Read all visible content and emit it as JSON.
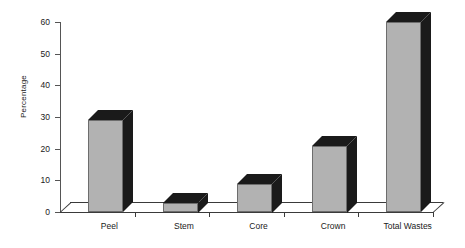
{
  "chart_data": {
    "type": "bar",
    "title": "",
    "subtitle": "",
    "xlabel": "",
    "ylabel": "Percentage",
    "categories": [
      "Peel",
      "Stem",
      "Core",
      "Crown",
      "Total Wastes"
    ],
    "values": [
      29,
      3,
      9,
      21,
      60
    ],
    "series": [
      {
        "name": "Percentage",
        "values": [
          29,
          3,
          9,
          21,
          60
        ]
      }
    ],
    "ylim": [
      0,
      60
    ],
    "yticks": [
      0,
      10,
      20,
      30,
      40,
      50,
      60
    ],
    "ytick_labels": [
      "0",
      "10",
      "20",
      "30",
      "40",
      "50",
      "60"
    ],
    "grid": false,
    "legend": false,
    "legend_position": "none",
    "style": "3d-column",
    "colors": {
      "bar_front": "#b2b2b2",
      "bar_shade": "#1a1a1a",
      "axis": "#3a3a3a",
      "text": "#1a1a1a",
      "background": "#ffffff"
    }
  }
}
